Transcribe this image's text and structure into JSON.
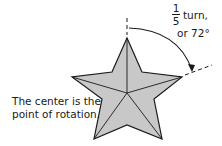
{
  "diagram": {
    "fraction": {
      "numerator": "1",
      "denominator": "5"
    },
    "turn_label": "turn,",
    "angle_label": "or 72°",
    "center_note_line1": "The center is the",
    "center_note_line2": "point of rotation.",
    "colors": {
      "star_fill": "#c8c8c8",
      "stroke": "#1a1a1a",
      "background": "#ffffff"
    }
  }
}
